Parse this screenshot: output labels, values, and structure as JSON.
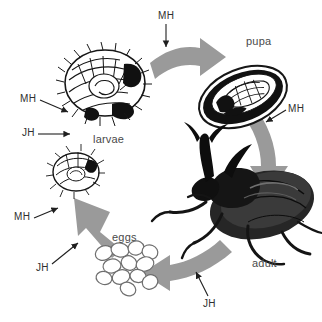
{
  "figure": {
    "background_color": "#ffffff",
    "arrow_color": "#9a9a9a",
    "ink_color": "#1a1a1a",
    "label_color": "#3b3b3b",
    "width": 322,
    "height": 322
  },
  "stages": [
    {
      "id": "eggs",
      "label": "eggs",
      "x": 112,
      "y": 232
    },
    {
      "id": "larvae",
      "label": "larvae",
      "x": 93,
      "y": 134
    },
    {
      "id": "pupa",
      "label": "pupa",
      "x": 246,
      "y": 36
    },
    {
      "id": "adult",
      "label": "adult",
      "x": 252,
      "y": 258
    }
  ],
  "hormone_labels": [
    {
      "id": "mh-top",
      "label": "MH",
      "x": 158,
      "y": 11
    },
    {
      "id": "mh-right",
      "label": "MH",
      "x": 288,
      "y": 104
    },
    {
      "id": "mh-larvae-upper",
      "label": "MH",
      "x": 20,
      "y": 94
    },
    {
      "id": "jh-larvae",
      "label": "JH",
      "x": 22,
      "y": 128
    },
    {
      "id": "mh-lower-left",
      "label": "MH",
      "x": 14,
      "y": 212
    },
    {
      "id": "jh-eggs",
      "label": "JH",
      "x": 36,
      "y": 263
    },
    {
      "id": "jh-bottom",
      "label": "JH",
      "x": 203,
      "y": 299
    }
  ],
  "cycle_arrows": [
    {
      "id": "larvae-to-pupa",
      "from": "larvae",
      "to": "pupa",
      "direction": "right"
    },
    {
      "id": "pupa-to-adult",
      "from": "pupa",
      "to": "adult",
      "direction": "down"
    },
    {
      "id": "adult-to-eggs",
      "from": "adult",
      "to": "eggs",
      "direction": "left"
    },
    {
      "id": "eggs-to-larvae",
      "from": "eggs",
      "to": "larvae",
      "direction": "up"
    }
  ],
  "illustrations": [
    {
      "id": "larva-large",
      "description": "curled grub larva, large"
    },
    {
      "id": "larva-small",
      "description": "curled grub larva, small"
    },
    {
      "id": "pupa-capsule",
      "description": "pupa inside oval capsule"
    },
    {
      "id": "beetle-adult",
      "description": "adult rhinoceros beetle with horn"
    },
    {
      "id": "egg-cluster",
      "description": "cluster of oval eggs"
    }
  ]
}
